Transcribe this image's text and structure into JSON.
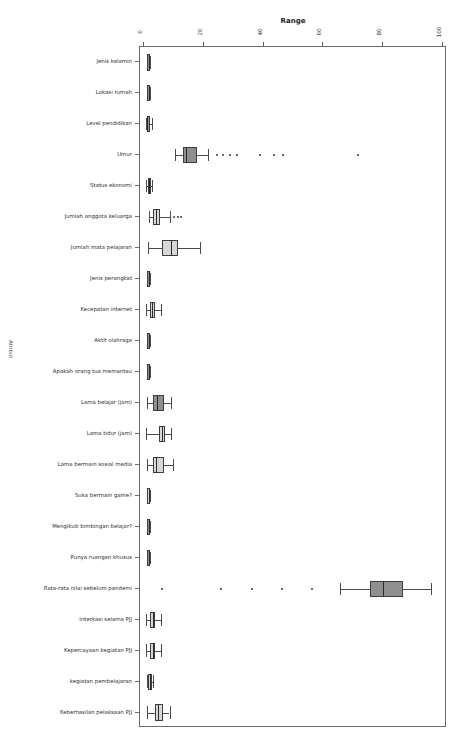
{
  "figure": {
    "title_right": "Penyebaran data diluar jangkauan",
    "xaxis_title": "Range",
    "yaxis_title": "Atribut"
  },
  "chart_data": {
    "type": "box",
    "title": "Penyebaran data diluar jangkauan",
    "xlabel": "Range",
    "ylabel": "Atribut",
    "orientation": "horizontal",
    "grid": false,
    "legend": "none",
    "xlim": [
      -1.5,
      101.5
    ],
    "xticks": [
      0,
      20,
      40,
      60,
      80,
      100
    ],
    "xtick_labels": [
      "0",
      "20",
      "40",
      "60",
      "80",
      "100"
    ],
    "categories": [
      "Jenis kelamin",
      "Lokasi rumah",
      "Level pendidikan",
      "Umur",
      "Status ekonomi",
      "Jumlah anggota keluarga",
      "Jumlah mata pelajaran",
      "Jenis perangkat",
      "Kecepatan internet",
      "Aktif olahraga",
      "Apakah orang tua memantau",
      "Lama belajar (jam)",
      "Lama tidur (jam)",
      "Lama bermain sosial media",
      "Suka bermain game?",
      "Mengikuti bimbingan belajar?",
      "Punya ruangan khusus",
      "Rata-rata nilai sebelum pandemi",
      "Interkasi selama PJJ",
      "Kepercayaan kegiatan PJJ",
      "kegiatan pembelajaran",
      "Keberhasilan pelaksaan PJJ"
    ],
    "boxes": [
      {
        "label": "Jenis kelamin",
        "whisker_low": 1.0,
        "q1": 1.0,
        "median": 1.5,
        "q3": 2.0,
        "whisker_high": 2.0,
        "outliers": [],
        "fill": "dark"
      },
      {
        "label": "Lokasi rumah",
        "whisker_low": 1.0,
        "q1": 1.0,
        "median": 1.5,
        "q3": 2.0,
        "whisker_high": 2.0,
        "outliers": [],
        "fill": "dark"
      },
      {
        "label": "Level pendidikan",
        "whisker_low": 0.6,
        "q1": 1.0,
        "median": 1.0,
        "q3": 1.2,
        "whisker_high": 2.4,
        "outliers": [],
        "fill": "dark"
      },
      {
        "label": "Umur",
        "whisker_low": 10.2,
        "q1": 12.8,
        "median": 14.0,
        "q3": 17.6,
        "whisker_high": 21.2,
        "outliers": [
          24.4,
          26.4,
          28.8,
          31.0,
          38.6,
          43.5,
          46.5,
          71.5
        ],
        "fill": "dark"
      },
      {
        "label": "Status ekonomi",
        "whisker_low": 0.6,
        "q1": 1.2,
        "median": 1.5,
        "q3": 1.7,
        "whisker_high": 2.5,
        "outliers": [],
        "fill": "dark"
      },
      {
        "label": "Jumlah anggota keluarga",
        "whisker_low": 1.6,
        "q1": 3.0,
        "median": 4.0,
        "q3": 5.2,
        "whisker_high": 8.6,
        "outliers": [
          9.8,
          11.4,
          12.2
        ],
        "fill": "light"
      },
      {
        "label": "Jumlah mata pelajaran",
        "whisker_low": 1.2,
        "q1": 6.0,
        "median": 9.0,
        "q3": 11.2,
        "whisker_high": 18.6,
        "outliers": [],
        "fill": "light"
      },
      {
        "label": "Jenis perangkat",
        "whisker_low": 1.0,
        "q1": 1.0,
        "median": 1.5,
        "q3": 2.0,
        "whisker_high": 2.0,
        "outliers": [],
        "fill": "dark"
      },
      {
        "label": "Kecepatan internet",
        "whisker_low": 0.6,
        "q1": 2.0,
        "median": 2.6,
        "q3": 3.4,
        "whisker_high": 5.4,
        "outliers": [],
        "fill": "light"
      },
      {
        "label": "Aktif olahraga",
        "whisker_low": 1.0,
        "q1": 1.0,
        "median": 1.5,
        "q3": 2.0,
        "whisker_high": 2.0,
        "outliers": [],
        "fill": "dark"
      },
      {
        "label": "Apakah orang tua memantau",
        "whisker_low": 1.0,
        "q1": 1.0,
        "median": 1.5,
        "q3": 2.0,
        "whisker_high": 2.0,
        "outliers": [],
        "fill": "dark"
      },
      {
        "label": "Lama belajar (jam)",
        "whisker_low": 1.0,
        "q1": 3.0,
        "median": 4.2,
        "q3": 6.4,
        "whisker_high": 9.0,
        "outliers": [],
        "fill": "dark"
      },
      {
        "label": "Lama tidur (jam)",
        "whisker_low": 0.6,
        "q1": 5.0,
        "median": 6.0,
        "q3": 7.0,
        "whisker_high": 9.0,
        "outliers": [],
        "fill": "light"
      },
      {
        "label": "Lama bermain sosial media",
        "whisker_low": 1.0,
        "q1": 3.0,
        "median": 4.0,
        "q3": 6.4,
        "whisker_high": 9.6,
        "outliers": [],
        "fill": "light"
      },
      {
        "label": "Suka bermain game?",
        "whisker_low": 1.0,
        "q1": 1.0,
        "median": 1.5,
        "q3": 2.0,
        "whisker_high": 2.0,
        "outliers": [],
        "fill": "light"
      },
      {
        "label": "Mengikuti bimbingan belajar?",
        "whisker_low": 1.0,
        "q1": 1.0,
        "median": 1.5,
        "q3": 2.0,
        "whisker_high": 2.0,
        "outliers": [],
        "fill": "dark"
      },
      {
        "label": "Punya ruangan khusus",
        "whisker_low": 1.0,
        "q1": 1.0,
        "median": 1.5,
        "q3": 2.0,
        "whisker_high": 2.0,
        "outliers": [],
        "fill": "dark"
      },
      {
        "label": "Rata-rata nilai sebelum pandemi",
        "whisker_low": 65.5,
        "q1": 75.8,
        "median": 80.0,
        "q3": 86.8,
        "whisker_high": 96.0,
        "outliers": [
          6.0,
          25.8,
          36.2,
          46.0,
          56.2
        ],
        "fill": "dark"
      },
      {
        "label": "Interkasi selama PJJ",
        "whisker_low": 0.6,
        "q1": 2.0,
        "median": 3.0,
        "q3": 3.6,
        "whisker_high": 5.4,
        "outliers": [],
        "fill": "light"
      },
      {
        "label": "Kepercayaan kegiatan PJJ",
        "whisker_low": 0.6,
        "q1": 2.0,
        "median": 3.0,
        "q3": 3.6,
        "whisker_high": 5.4,
        "outliers": [],
        "fill": "light"
      },
      {
        "label": "kegiatan pembelajaran",
        "whisker_low": 1.0,
        "q1": 1.2,
        "median": 1.8,
        "q3": 2.4,
        "whisker_high": 2.8,
        "outliers": [],
        "fill": "light"
      },
      {
        "label": "Keberhasilan pelaksaan PJJ",
        "whisker_low": 1.0,
        "q1": 3.6,
        "median": 4.6,
        "q3": 6.2,
        "whisker_high": 8.4,
        "outliers": [],
        "fill": "light"
      }
    ],
    "colors": {
      "box_dark": "#8f8f8f",
      "box_light": "#d8d8d8",
      "edge": "#3f3f3f",
      "whisker": "#4a4a4a",
      "outlier": "#3a3a3a",
      "frame": "#6b6b6b",
      "text": "#2e2e2e"
    }
  }
}
